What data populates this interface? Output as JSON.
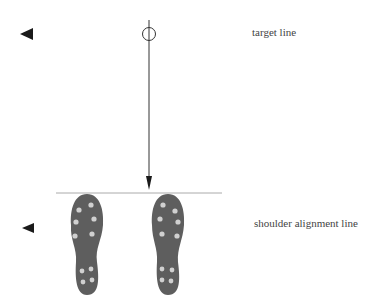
{
  "diagram": {
    "labels": {
      "target_line": "target line",
      "shoulder_line": "shoulder alignment line"
    },
    "colors": {
      "line": "#2a2a2a",
      "shoe": "#5e5e5e",
      "stud": "#d0d0d0",
      "guide": "#bbbbbb"
    }
  }
}
